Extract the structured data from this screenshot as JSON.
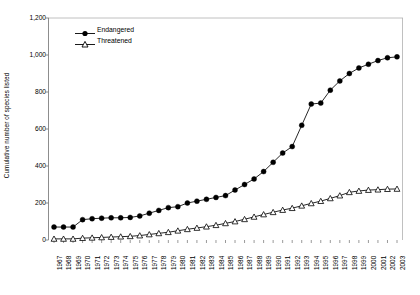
{
  "chart_data": {
    "type": "line",
    "title": "",
    "xlabel": "",
    "ylabel": "Cumulative number of species listed",
    "ylim": [
      0,
      1200
    ],
    "y_ticks": [
      0,
      200,
      400,
      600,
      800,
      1000,
      1200
    ],
    "y_tick_labels": [
      "0",
      "200",
      "400",
      "600",
      "800",
      "1,000",
      "1,200"
    ],
    "grid": "top-only",
    "legend_position": "upper-left-inside",
    "categories": [
      "1967",
      "1968",
      "1969",
      "1970",
      "1971",
      "1972",
      "1973",
      "1974",
      "1975",
      "1976",
      "1977",
      "1978",
      "1979",
      "1980",
      "1981",
      "1982",
      "1983",
      "1984",
      "1985",
      "1986",
      "1987",
      "1988",
      "1989",
      "1990",
      "1991",
      "1992",
      "1993",
      "1994",
      "1995",
      "1996",
      "1997",
      "1998",
      "1999",
      "2000",
      "2001",
      "2002",
      "2003"
    ],
    "series": [
      {
        "name": "Endangered",
        "marker": "filled-circle",
        "color": "#000000",
        "values": [
          70,
          70,
          70,
          110,
          115,
          118,
          120,
          120,
          122,
          130,
          145,
          160,
          175,
          180,
          200,
          210,
          220,
          230,
          240,
          270,
          300,
          330,
          370,
          420,
          470,
          505,
          620,
          735,
          740,
          810,
          860,
          900,
          930,
          950,
          970,
          985,
          990
        ]
      },
      {
        "name": "Threatened",
        "marker": "open-triangle",
        "color": "#000000",
        "values": [
          6,
          6,
          6,
          10,
          12,
          14,
          16,
          18,
          20,
          24,
          30,
          36,
          42,
          50,
          58,
          65,
          72,
          80,
          90,
          100,
          112,
          125,
          138,
          150,
          162,
          172,
          185,
          198,
          210,
          225,
          240,
          258,
          265,
          270,
          272,
          275,
          276
        ]
      }
    ]
  },
  "legend": {
    "items": [
      {
        "label": "Endangered",
        "marker": "filled-circle"
      },
      {
        "label": "Threatened",
        "marker": "open-triangle"
      }
    ]
  }
}
